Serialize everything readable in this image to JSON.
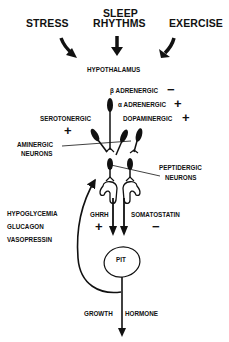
{
  "inputs": {
    "stress": "STRESS",
    "sleep_line1": "SLEEP",
    "sleep_line2": "RHYTHMS",
    "exercise": "EXERCISE"
  },
  "hypothalamus": "HYPOTHALAMUS",
  "receptors": {
    "beta_adrenergic": "β ADRENERGIC",
    "beta_sign": "−",
    "alpha_adrenergic": "α ADRENERGIC",
    "alpha_sign": "+",
    "dopaminergic": "DOPAMINERGIC",
    "dopaminergic_sign": "+",
    "serotonergic": "SEROTONERGIC",
    "serotonergic_sign": "+"
  },
  "neurons": {
    "aminergic_line1": "AMINERGIC",
    "aminergic_line2": "NEURONS",
    "peptidergic_line1": "PEPTIDERGIC",
    "peptidergic_line2": "NEURONS"
  },
  "feedback": {
    "items": [
      "HYPOGLYCEMIA",
      "GLUCAGON",
      "VASOPRESSIN"
    ]
  },
  "hormones": {
    "ghrh": "GHRH",
    "ghrh_sign": "+",
    "somatostatin": "SOMATOSTATIN",
    "somatostatin_sign": "−"
  },
  "pituitary": "PIT",
  "output": {
    "growth": "GROWTH",
    "hormone": "HORMONE"
  }
}
